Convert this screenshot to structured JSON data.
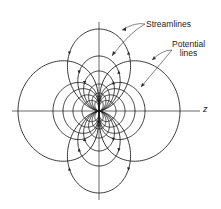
{
  "figure": {
    "type": "dipole flow field",
    "axis_label": "z",
    "labels": {
      "streamlines": "Streamlines",
      "potential_line1": "Potential",
      "potential_line2": "lines"
    },
    "origin": [
      99,
      111
    ],
    "streamline_sizes": [
      82,
      55,
      40,
      27,
      18,
      11
    ],
    "potential_sizes": [
      81,
      46,
      36,
      26,
      17
    ],
    "line_color": "#222222",
    "axis_color": "#444444",
    "background": "#ffffff"
  }
}
